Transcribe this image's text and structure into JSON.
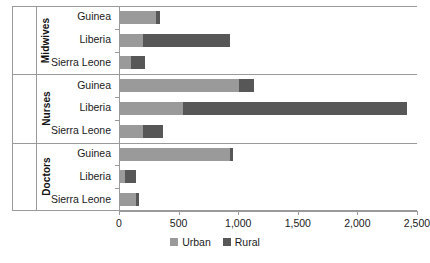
{
  "chart_data": {
    "type": "bar",
    "orientation": "horizontal",
    "stacked": true,
    "title": "",
    "subtitle": "",
    "xlabel": "",
    "ylabel": "",
    "xlim": [
      0,
      2500
    ],
    "xticks": [
      0,
      500,
      1000,
      1500,
      2000,
      2500
    ],
    "xtick_labels": [
      "0",
      "500",
      "1,000",
      "1,500",
      "2,000",
      "2,500"
    ],
    "grid": false,
    "legend_position": "bottom-center",
    "legend": [
      {
        "name": "Urban",
        "color": "#9a9a9a"
      },
      {
        "name": "Rural",
        "color": "#575757"
      }
    ],
    "series": [
      {
        "name": "Urban",
        "color": "#9a9a9a",
        "values": [
          310,
          200,
          100,
          1010,
          535,
          205,
          930,
          50,
          140
        ]
      },
      {
        "name": "Rural",
        "color": "#575757",
        "values": [
          35,
          730,
          120,
          125,
          1885,
          165,
          25,
          95,
          30
        ]
      }
    ],
    "groups": [
      {
        "label": "Midwives",
        "categories": [
          "Guinea",
          "Liberia",
          "Sierra Leone"
        ],
        "urban": [
          310,
          200,
          100
        ],
        "rural": [
          35,
          730,
          120
        ],
        "totals": [
          345,
          930,
          220
        ]
      },
      {
        "label": "Nurses",
        "categories": [
          "Guinea",
          "Liberia",
          "Sierra Leone"
        ],
        "urban": [
          1010,
          535,
          205
        ],
        "rural": [
          125,
          1885,
          165
        ],
        "totals": [
          1135,
          2420,
          370
        ]
      },
      {
        "label": "Doctors",
        "categories": [
          "Guinea",
          "Liberia",
          "Sierra Leone"
        ],
        "urban": [
          930,
          50,
          140
        ],
        "rural": [
          25,
          95,
          30
        ],
        "totals": [
          955,
          145,
          170
        ]
      }
    ]
  },
  "colors": {
    "urban": "#9a9a9a",
    "rural": "#575757",
    "axis": "#9a9a9a",
    "text": "#1a1a1a",
    "background": "#ffffff"
  },
  "groups": [
    {
      "label": "Midwives",
      "rows": [
        {
          "category": "Guinea",
          "urban": 310,
          "rural": 35
        },
        {
          "category": "Liberia",
          "urban": 200,
          "rural": 730
        },
        {
          "category": "Sierra Leone",
          "urban": 100,
          "rural": 120
        }
      ]
    },
    {
      "label": "Nurses",
      "rows": [
        {
          "category": "Guinea",
          "urban": 1010,
          "rural": 125
        },
        {
          "category": "Liberia",
          "urban": 535,
          "rural": 1885
        },
        {
          "category": "Sierra Leone",
          "urban": 205,
          "rural": 165
        }
      ]
    },
    {
      "label": "Doctors",
      "rows": [
        {
          "category": "Guinea",
          "urban": 930,
          "rural": 25
        },
        {
          "category": "Liberia",
          "urban": 50,
          "rural": 95
        },
        {
          "category": "Sierra Leone",
          "urban": 140,
          "rural": 30
        }
      ]
    }
  ],
  "axis": {
    "ticks": [
      {
        "value": 0,
        "label": "0"
      },
      {
        "value": 500,
        "label": "500"
      },
      {
        "value": 1000,
        "label": "1,000"
      },
      {
        "value": 1500,
        "label": "1,500"
      },
      {
        "value": 2000,
        "label": "2,000"
      },
      {
        "value": 2500,
        "label": "2,500"
      }
    ]
  },
  "legend": {
    "items": [
      {
        "label": "Urban",
        "key": "urban"
      },
      {
        "label": "Rural",
        "key": "rural"
      }
    ]
  }
}
